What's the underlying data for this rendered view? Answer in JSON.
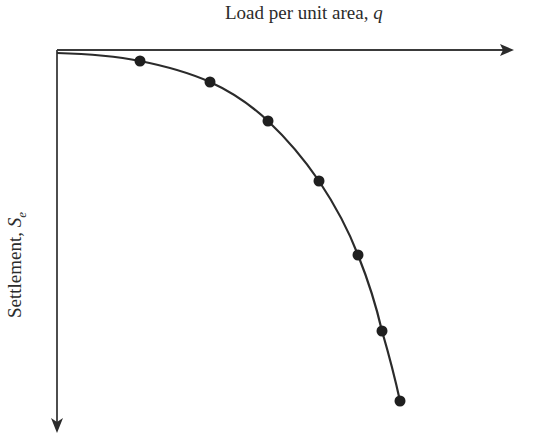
{
  "chart_data": {
    "type": "line",
    "title": "",
    "xlabel": "Load per unit area, q",
    "ylabel": "Settlement, S_e",
    "x_axis": {
      "label_text": "Load per unit area, ",
      "label_var": "q",
      "position": "top",
      "direction": "right"
    },
    "y_axis": {
      "label_text": "Settlement, ",
      "label_var": "S",
      "label_sub": "e",
      "direction": "down"
    },
    "grid": false,
    "legend": null,
    "series": [
      {
        "name": "load-settlement curve",
        "markers": true,
        "points_pixel": [
          [
            140,
            61
          ],
          [
            210,
            82
          ],
          [
            268,
            121
          ],
          [
            319,
            181
          ],
          [
            358,
            255
          ],
          [
            382,
            331
          ],
          [
            400,
            401
          ]
        ],
        "curve_start_pixel": [
          57,
          53
        ]
      }
    ],
    "colors": {
      "axis": "#3a3a3a",
      "curve": "#2b2b2b",
      "marker": "#1f1f1f"
    }
  }
}
